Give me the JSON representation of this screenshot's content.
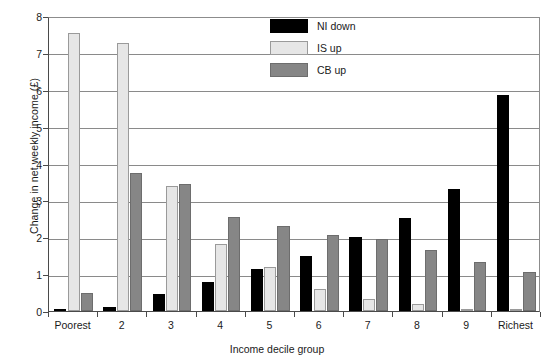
{
  "chart_data": {
    "type": "bar",
    "title": "",
    "xlabel": "Income decile group",
    "ylabel": "Change in net weekly income (£)",
    "ylim": [
      0,
      8
    ],
    "yticks": [
      0,
      1,
      2,
      3,
      4,
      5,
      6,
      7,
      8
    ],
    "ytick_labels": [
      "0",
      "1",
      "2",
      "3",
      "4",
      "5",
      "6",
      "7",
      "8"
    ],
    "grid": true,
    "legend_position": "top-center",
    "categories": [
      "Poorest",
      "2",
      "3",
      "4",
      "5",
      "6",
      "7",
      "8",
      "9",
      "Richest"
    ],
    "series": [
      {
        "name": "NI down",
        "color": "#000000",
        "values": [
          0.02,
          0.12,
          0.45,
          0.78,
          1.15,
          1.5,
          2.0,
          2.52,
          3.32,
          5.85
        ]
      },
      {
        "name": "IS up",
        "color": "#e6e6e6",
        "values": [
          7.55,
          7.28,
          3.4,
          1.82,
          1.2,
          0.6,
          0.32,
          0.2,
          0.02,
          0.03
        ]
      },
      {
        "name": "CB up",
        "color": "#868686",
        "values": [
          0.5,
          3.75,
          3.45,
          2.55,
          2.3,
          2.05,
          1.95,
          1.65,
          1.32,
          1.05
        ]
      }
    ]
  },
  "legend": {
    "items": [
      {
        "label": "NI down",
        "swatch": "ni"
      },
      {
        "label": "IS up",
        "swatch": "is"
      },
      {
        "label": "CB up",
        "swatch": "cb"
      }
    ]
  },
  "axes": {
    "y_title": "Change in net weekly income (£)",
    "x_title": "Income decile group"
  }
}
